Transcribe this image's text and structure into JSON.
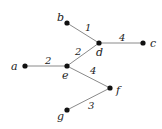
{
  "diagram": {
    "type": "weighted-tree",
    "nodes": [
      {
        "id": "a",
        "label": "a",
        "x": 25,
        "y": 66,
        "lx": 11,
        "ly": 70
      },
      {
        "id": "b",
        "label": "b",
        "x": 67,
        "y": 23,
        "lx": 57,
        "ly": 21
      },
      {
        "id": "c",
        "label": "c",
        "x": 143,
        "y": 43,
        "lx": 150,
        "ly": 47
      },
      {
        "id": "d",
        "label": "d",
        "x": 99,
        "y": 43,
        "lx": 96,
        "ly": 56
      },
      {
        "id": "e",
        "label": "e",
        "x": 67,
        "y": 66,
        "lx": 62,
        "ly": 79
      },
      {
        "id": "f",
        "label": "f",
        "x": 110,
        "y": 88,
        "lx": 116,
        "ly": 94
      },
      {
        "id": "g",
        "label": "g",
        "x": 67,
        "y": 110,
        "lx": 57,
        "ly": 120
      }
    ],
    "edges": [
      {
        "from": "b",
        "to": "d",
        "weight": "1",
        "wx": 85,
        "wy": 31
      },
      {
        "from": "d",
        "to": "c",
        "weight": "4",
        "wx": 119,
        "wy": 41
      },
      {
        "from": "e",
        "to": "d",
        "weight": "2",
        "wx": 75,
        "wy": 55
      },
      {
        "from": "a",
        "to": "e",
        "weight": "2",
        "wx": 45,
        "wy": 64
      },
      {
        "from": "e",
        "to": "f",
        "weight": "4",
        "wx": 90,
        "wy": 74
      },
      {
        "from": "g",
        "to": "f",
        "weight": "3",
        "wx": 88,
        "wy": 109
      }
    ]
  }
}
